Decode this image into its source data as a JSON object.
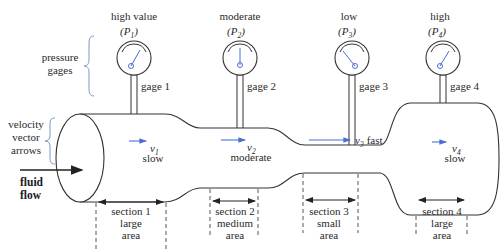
{
  "diagram": {
    "left_labels": {
      "pressure_gages": [
        "pressure",
        "gages"
      ],
      "velocity_vector_arrows": [
        "velocity",
        "vector",
        "arrows"
      ],
      "fluid_flow": [
        "fluid",
        "flow"
      ]
    },
    "gauges": [
      {
        "reading": "high value",
        "symbol": "P",
        "subscript": "1",
        "label": "gage 1"
      },
      {
        "reading": "moderate",
        "symbol": "P",
        "subscript": "2",
        "label": "gage 2"
      },
      {
        "reading": "low",
        "symbol": "P",
        "subscript": "3",
        "label": "gage 3"
      },
      {
        "reading": "high",
        "symbol": "P",
        "subscript": "4",
        "label": "gage 4"
      }
    ],
    "velocities": [
      {
        "symbol": "v",
        "subscript": "1",
        "speed": "slow"
      },
      {
        "symbol": "v",
        "subscript": "2",
        "speed": "moderate"
      },
      {
        "symbol": "v",
        "subscript": "3",
        "speed": "fast"
      },
      {
        "symbol": "v",
        "subscript": "4",
        "speed": "slow"
      }
    ],
    "sections": [
      {
        "name": "section 1",
        "size": "large",
        "unit": "area"
      },
      {
        "name": "section 2",
        "size": "medium",
        "unit": "area"
      },
      {
        "name": "section 3",
        "size": "small",
        "unit": "area"
      },
      {
        "name": "section 4",
        "size": "large",
        "unit": "area"
      }
    ],
    "colors": {
      "outline": "#333333",
      "accent_blue": "#4a6fd0",
      "brace_blue": "#7a96c8",
      "text": "#2a2a2a"
    }
  }
}
